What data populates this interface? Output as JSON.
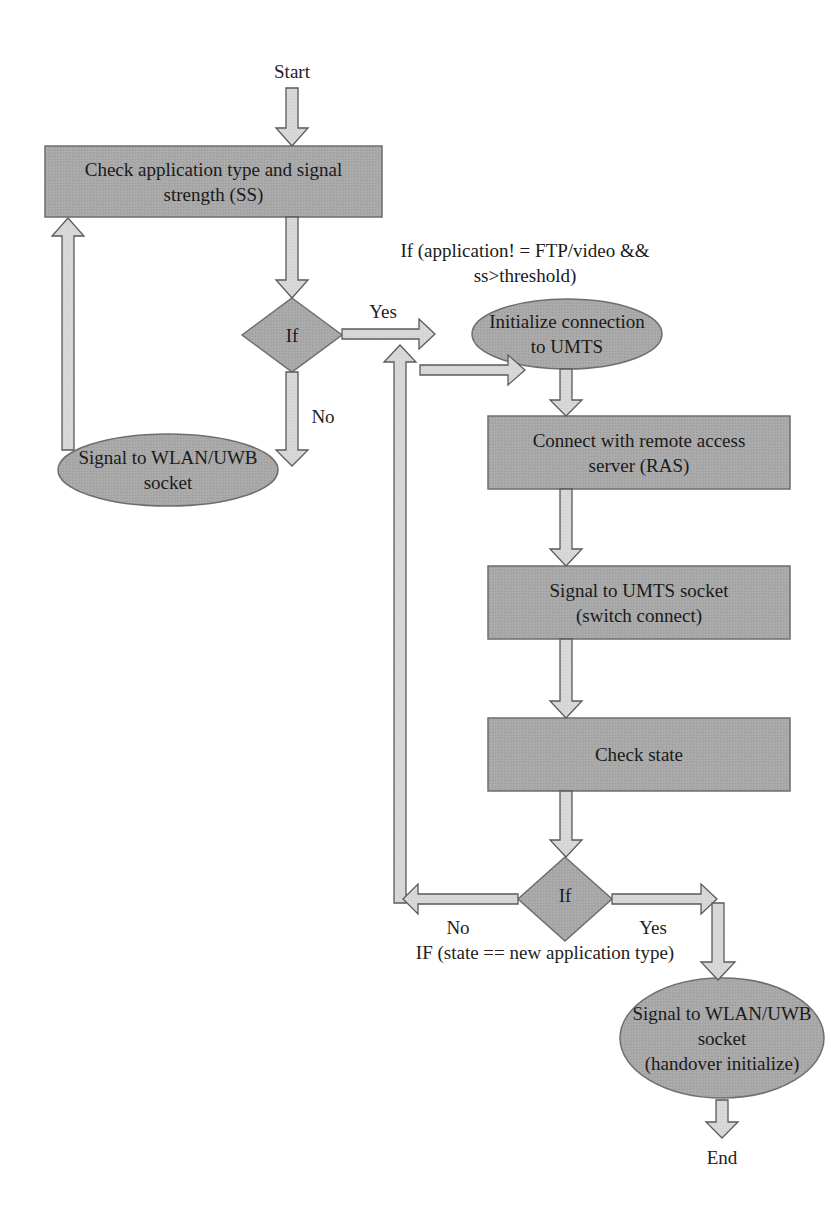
{
  "diagram": {
    "type": "flowchart",
    "colors": {
      "node_fill": "#a9a9a9",
      "node_stroke": "#6e6e6e",
      "arrow_fill": "#d9d9d9",
      "arrow_stroke": "#5a5a5a",
      "text": "#1e1e1e",
      "background": "#ffffff"
    },
    "terminals": {
      "start": "Start",
      "end": "End"
    },
    "nodes": {
      "check_app": {
        "shape": "rectangle",
        "label": "Check application type and signal\nstrength (SS)"
      },
      "decision1": {
        "shape": "diamond",
        "label": "If"
      },
      "init_umts": {
        "shape": "ellipse",
        "label": "Initialize connection\nto UMTS"
      },
      "signal_wlan": {
        "shape": "ellipse",
        "label": "Signal to WLAN/UWB\nsocket"
      },
      "connect_ras": {
        "shape": "rectangle",
        "label": "Connect with remote access\nserver (RAS)"
      },
      "signal_umts": {
        "shape": "rectangle",
        "label": "Signal to UMTS socket\n(switch connect)"
      },
      "check_state": {
        "shape": "rectangle",
        "label": "Check state"
      },
      "decision2": {
        "shape": "diamond",
        "label": "If"
      },
      "handover": {
        "shape": "ellipse",
        "label": "Signal to WLAN/UWB\nsocket\n(handover initialize)"
      }
    },
    "annotations": {
      "condition1": "If (application! = FTP/video &&\nss>threshold)",
      "condition2": "IF (state == new application type)"
    },
    "edge_labels": {
      "d1_yes": "Yes",
      "d1_no": "No",
      "d2_no": "No",
      "d2_yes": "Yes"
    },
    "edges": [
      {
        "from": "start",
        "to": "check_app"
      },
      {
        "from": "check_app",
        "to": "decision1"
      },
      {
        "from": "decision1",
        "to": "init_umts",
        "label": "Yes"
      },
      {
        "from": "decision1",
        "to": "signal_wlan",
        "label": "No"
      },
      {
        "from": "signal_wlan",
        "to": "check_app"
      },
      {
        "from": "init_umts",
        "to": "connect_ras"
      },
      {
        "from": "connect_ras",
        "to": "signal_umts"
      },
      {
        "from": "signal_umts",
        "to": "check_state"
      },
      {
        "from": "check_state",
        "to": "decision2"
      },
      {
        "from": "decision2",
        "to": "connect_ras",
        "label": "No"
      },
      {
        "from": "decision2",
        "to": "handover",
        "label": "Yes"
      },
      {
        "from": "handover",
        "to": "end"
      }
    ]
  }
}
